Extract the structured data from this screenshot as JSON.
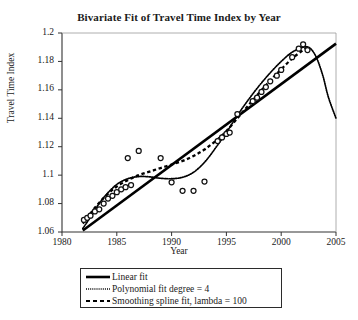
{
  "chart_data": {
    "type": "scatter",
    "title": "Bivariate Fit of Travel Time Index by Year",
    "xlabel": "Year",
    "ylabel": "Travel Time Index",
    "xlim": [
      1980,
      2005
    ],
    "ylim": [
      1.06,
      1.2
    ],
    "xticks": [
      "1980",
      "1985",
      "1990",
      "1995",
      "2000",
      "2005"
    ],
    "xtick_values": [
      1980,
      1985,
      1990,
      1995,
      2000,
      2005
    ],
    "yticks": [
      "1.06",
      "1.08",
      "1.1",
      "1.12",
      "1.14",
      "1.16",
      "1.18",
      "1.2"
    ],
    "ytick_values": [
      1.06,
      1.08,
      1.1,
      1.12,
      1.14,
      1.16,
      1.18,
      1.2
    ],
    "grid": false,
    "legend_position": "below-axes",
    "marker": "open-circle",
    "points": [
      {
        "x": 1982.0,
        "y": 1.0685
      },
      {
        "x": 1982.3,
        "y": 1.07
      },
      {
        "x": 1982.6,
        "y": 1.0715
      },
      {
        "x": 1983.0,
        "y": 1.0745
      },
      {
        "x": 1983.4,
        "y": 1.076
      },
      {
        "x": 1983.8,
        "y": 1.08
      },
      {
        "x": 1984.2,
        "y": 1.0835
      },
      {
        "x": 1984.6,
        "y": 1.0855
      },
      {
        "x": 1985.0,
        "y": 1.088
      },
      {
        "x": 1985.4,
        "y": 1.09
      },
      {
        "x": 1985.8,
        "y": 1.0915
      },
      {
        "x": 1986.0,
        "y": 1.112
      },
      {
        "x": 1987.0,
        "y": 1.117
      },
      {
        "x": 1986.3,
        "y": 1.093
      },
      {
        "x": 1989.0,
        "y": 1.112
      },
      {
        "x": 1990.0,
        "y": 1.095
      },
      {
        "x": 1991.0,
        "y": 1.089
      },
      {
        "x": 1992.0,
        "y": 1.089
      },
      {
        "x": 1993.0,
        "y": 1.0955
      },
      {
        "x": 1994.2,
        "y": 1.124
      },
      {
        "x": 1994.6,
        "y": 1.1265
      },
      {
        "x": 1995.0,
        "y": 1.129
      },
      {
        "x": 1995.3,
        "y": 1.13
      },
      {
        "x": 1996.0,
        "y": 1.143
      },
      {
        "x": 1997.4,
        "y": 1.152
      },
      {
        "x": 1997.8,
        "y": 1.1545
      },
      {
        "x": 1998.2,
        "y": 1.1585
      },
      {
        "x": 1998.6,
        "y": 1.162
      },
      {
        "x": 1999.0,
        "y": 1.166
      },
      {
        "x": 1999.6,
        "y": 1.17
      },
      {
        "x": 2000.0,
        "y": 1.174
      },
      {
        "x": 2001.0,
        "y": 1.183
      },
      {
        "x": 2001.6,
        "y": 1.189
      },
      {
        "x": 2002.0,
        "y": 1.192
      },
      {
        "x": 2002.4,
        "y": 1.188
      }
    ],
    "series": [
      {
        "name": "Linear fit",
        "style": "solid",
        "color": "#000000",
        "points": [
          {
            "x": 1981.9,
            "y": 1.061
          },
          {
            "x": 2005.0,
            "y": 1.1925
          }
        ]
      },
      {
        "name": "Polynomial fit degree = 4",
        "style": "dotted",
        "color": "#000000",
        "points": [
          {
            "x": 1981.9,
            "y": 1.0625
          },
          {
            "x": 1982.6,
            "y": 1.0705
          },
          {
            "x": 1983.3,
            "y": 1.079
          },
          {
            "x": 1984.0,
            "y": 1.086
          },
          {
            "x": 1985.0,
            "y": 1.0935
          },
          {
            "x": 1986.0,
            "y": 1.0975
          },
          {
            "x": 1987.0,
            "y": 1.099
          },
          {
            "x": 1988.0,
            "y": 1.0988
          },
          {
            "x": 1989.0,
            "y": 1.0978
          },
          {
            "x": 1990.0,
            "y": 1.0975
          },
          {
            "x": 1991.0,
            "y": 1.0985
          },
          {
            "x": 1992.0,
            "y": 1.102
          },
          {
            "x": 1993.0,
            "y": 1.109
          },
          {
            "x": 1994.0,
            "y": 1.119
          },
          {
            "x": 1995.0,
            "y": 1.13
          },
          {
            "x": 1996.0,
            "y": 1.142
          },
          {
            "x": 1997.0,
            "y": 1.153
          },
          {
            "x": 1998.0,
            "y": 1.163
          },
          {
            "x": 1999.0,
            "y": 1.172
          },
          {
            "x": 2000.0,
            "y": 1.18
          },
          {
            "x": 2001.0,
            "y": 1.1865
          },
          {
            "x": 2002.0,
            "y": 1.19
          },
          {
            "x": 2002.6,
            "y": 1.1895
          },
          {
            "x": 2003.2,
            "y": 1.183
          },
          {
            "x": 2003.8,
            "y": 1.17
          },
          {
            "x": 2004.3,
            "y": 1.155
          },
          {
            "x": 2005.0,
            "y": 1.14
          }
        ]
      },
      {
        "name": "Smoothing spline fit, lambda = 100",
        "style": "dashed",
        "color": "#000000",
        "points": [
          {
            "x": 1981.9,
            "y": 1.066
          },
          {
            "x": 1983.0,
            "y": 1.077
          },
          {
            "x": 1984.0,
            "y": 1.0855
          },
          {
            "x": 1985.0,
            "y": 1.092
          },
          {
            "x": 1986.0,
            "y": 1.0965
          },
          {
            "x": 1987.0,
            "y": 1.1
          },
          {
            "x": 1988.0,
            "y": 1.1025
          },
          {
            "x": 1989.0,
            "y": 1.105
          },
          {
            "x": 1990.0,
            "y": 1.1075
          },
          {
            "x": 1991.0,
            "y": 1.11
          },
          {
            "x": 1992.0,
            "y": 1.1135
          },
          {
            "x": 1993.0,
            "y": 1.118
          },
          {
            "x": 1994.0,
            "y": 1.124
          },
          {
            "x": 1995.0,
            "y": 1.131
          },
          {
            "x": 1996.0,
            "y": 1.14
          },
          {
            "x": 1997.0,
            "y": 1.149
          },
          {
            "x": 1998.0,
            "y": 1.158
          },
          {
            "x": 1999.0,
            "y": 1.1665
          },
          {
            "x": 2000.0,
            "y": 1.1745
          },
          {
            "x": 2001.0,
            "y": 1.182
          },
          {
            "x": 2002.0,
            "y": 1.188
          },
          {
            "x": 2002.6,
            "y": 1.1905
          }
        ]
      }
    ],
    "legend": [
      {
        "label": "Linear fit",
        "style": "solid"
      },
      {
        "label": "Polynomial fit degree = 4",
        "style": "dotted"
      },
      {
        "label": "Smoothing spline fit, lambda = 100",
        "style": "dashed"
      }
    ]
  }
}
